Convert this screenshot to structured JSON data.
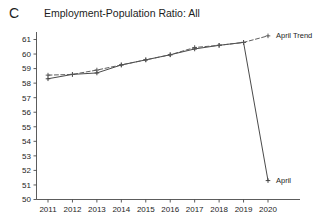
{
  "figure": {
    "panel_label": "C",
    "title": "Employment-Population Ratio: All"
  },
  "chart_data": {
    "type": "line",
    "title": "Employment-Population Ratio: All",
    "xlabel": "",
    "ylabel": "",
    "x": [
      2011,
      2012,
      2013,
      2014,
      2015,
      2016,
      2017,
      2018,
      2019,
      2020
    ],
    "categories": [
      "2011",
      "2012",
      "2013",
      "2014",
      "2015",
      "2016",
      "2017",
      "2018",
      "2019",
      "2020"
    ],
    "series": [
      {
        "name": "April",
        "style": "solid",
        "marker": "plus",
        "color": "#404040",
        "values": [
          58.3,
          58.6,
          58.7,
          59.25,
          59.6,
          59.95,
          60.35,
          60.6,
          60.8,
          51.3
        ]
      },
      {
        "name": "April Trend",
        "style": "dashed",
        "marker": "plus",
        "color": "#555555",
        "values": [
          58.55,
          58.6,
          58.9,
          59.25,
          59.6,
          59.95,
          60.45,
          60.6,
          60.8,
          61.25
        ]
      }
    ],
    "xlim": [
      2010.6,
      2020.6
    ],
    "ylim": [
      50,
      61.6
    ],
    "yticks": [
      50,
      51,
      52,
      53,
      54,
      55,
      56,
      57,
      58,
      59,
      60,
      61
    ],
    "ytick_labels": [
      "50",
      "51",
      "52",
      "53",
      "54",
      "55",
      "56",
      "57",
      "58",
      "59",
      "60",
      "61"
    ],
    "xticks": [
      2011,
      2012,
      2013,
      2014,
      2015,
      2016,
      2017,
      2018,
      2019,
      2020
    ],
    "xtick_labels": [
      "2011",
      "2012",
      "2013",
      "2014",
      "2015",
      "2016",
      "2017",
      "2018",
      "2019",
      "2020"
    ],
    "grid": false,
    "legend_position": "inline-right",
    "annotations": [
      {
        "text": "April Trend",
        "x": 2020,
        "y": 61.25,
        "placement": "right"
      },
      {
        "text": "April",
        "x": 2020,
        "y": 51.3,
        "placement": "right"
      }
    ]
  },
  "colors": {
    "axis": "#4a4a4a",
    "series_april": "#404040",
    "series_april_trend": "#555555",
    "text": "#1d1d1d",
    "background": "#ffffff"
  }
}
